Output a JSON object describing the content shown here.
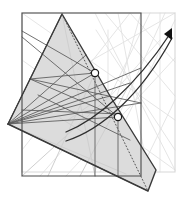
{
  "figure": {
    "canvas": {
      "width": 183,
      "height": 204,
      "background": "#ffffff"
    },
    "colors": {
      "stroke_dark": "#3a3a3a",
      "stroke_mid": "#5d5d5d",
      "stroke_light": "#cfcfcf",
      "stroke_faint": "#e2e2e2",
      "shape_fill": "#dcdcdc",
      "marker_fill": "#ffffff",
      "marker_stroke": "#1a1a1a",
      "arrow_fill": "#111111",
      "rect_outline_dark": "#4a4a4a",
      "rect_outline_light": "#d8d8d8"
    },
    "elements": {
      "outer_rect_dark": {
        "name": "bounding-rectangle-dark",
        "x": 22,
        "y": 13,
        "width": 119,
        "height": 163,
        "stroke": "#4a4a4a",
        "stroke_width": 1.1,
        "fill": "none"
      },
      "outer_rect_light": {
        "name": "bounding-rectangle-light",
        "x": 22,
        "y": 13,
        "width": 153,
        "height": 159,
        "stroke": "#d8d8d8",
        "stroke_width": 1.1,
        "fill": "none"
      },
      "shaded_polygon": {
        "name": "shaded-visibility-polygon",
        "points": "62,14 8,124 148,191 156,170 110,96",
        "fill": "#dcdcdc",
        "stroke": "#3a3a3a",
        "stroke_width": 1.4
      },
      "dotted_edge": {
        "name": "dotted-polygon-edge",
        "from": [
          62,
          14
        ],
        "to": [
          148,
          191
        ],
        "stroke": "#555555",
        "dash": "1.6 1.8",
        "stroke_width": 1.0
      },
      "markers": [
        {
          "name": "node-marker-upper",
          "cx": 95,
          "cy": 73,
          "r": 3.6
        },
        {
          "name": "node-marker-lower",
          "cx": 118,
          "cy": 117,
          "r": 3.6
        }
      ],
      "curves": [
        {
          "name": "trajectory-curve-upper",
          "path": "M 66,132 C 96,120 134,88 170,34",
          "stroke": "#2e2e2e",
          "stroke_width": 1.3
        },
        {
          "name": "trajectory-curve-lower",
          "path": "M 66,141 C 100,130 140,97 172,38",
          "stroke": "#2e2e2e",
          "stroke_width": 1.3
        }
      ],
      "arrowhead": {
        "name": "trajectory-arrowhead",
        "points": "172,28 172,40 164,34",
        "fill": "#111111"
      },
      "dark_chords": [
        {
          "name": "chord-dark-1",
          "x1": 8,
          "y1": 124,
          "x2": 62,
          "y2": 14
        },
        {
          "name": "chord-dark-2",
          "x1": 8,
          "y1": 124,
          "x2": 95,
          "y2": 73
        },
        {
          "name": "chord-dark-3",
          "x1": 8,
          "y1": 124,
          "x2": 118,
          "y2": 117
        },
        {
          "name": "chord-dark-4",
          "x1": 8,
          "y1": 124,
          "x2": 141,
          "y2": 103
        },
        {
          "name": "chord-dark-5",
          "x1": 8,
          "y1": 124,
          "x2": 130,
          "y2": 83
        },
        {
          "name": "chord-dark-6",
          "x1": 8,
          "y1": 124,
          "x2": 110,
          "y2": 96
        },
        {
          "name": "chord-dark-7",
          "x1": 8,
          "y1": 124,
          "x2": 86,
          "y2": 55
        },
        {
          "name": "chord-dark-8",
          "x1": 8,
          "y1": 124,
          "x2": 148,
          "y2": 191
        },
        {
          "name": "chord-dark-9",
          "x1": 22,
          "y1": 31,
          "x2": 95,
          "y2": 73
        },
        {
          "name": "chord-dark-10",
          "x1": 22,
          "y1": 37,
          "x2": 118,
          "y2": 117
        },
        {
          "name": "chord-dark-11",
          "x1": 30,
          "y1": 79,
          "x2": 118,
          "y2": 117
        },
        {
          "name": "chord-dark-12",
          "x1": 30,
          "y1": 79,
          "x2": 95,
          "y2": 73
        },
        {
          "name": "chord-dark-13",
          "x1": 30,
          "y1": 79,
          "x2": 141,
          "y2": 103
        },
        {
          "name": "chord-dark-14",
          "x1": 95,
          "y1": 73,
          "x2": 95,
          "y2": 176
        },
        {
          "name": "chord-dark-15",
          "x1": 118,
          "y1": 117,
          "x2": 118,
          "y2": 176
        },
        {
          "name": "chord-dark-16",
          "x1": 8,
          "y1": 124,
          "x2": 141,
          "y2": 68
        },
        {
          "name": "chord-dark-17",
          "x1": 38,
          "y1": 95,
          "x2": 130,
          "y2": 140
        },
        {
          "name": "chord-dark-18",
          "x1": 22,
          "y1": 110,
          "x2": 120,
          "y2": 114
        }
      ],
      "mid_chords": [
        {
          "name": "chord-mid-1",
          "x1": 62,
          "y1": 14,
          "x2": 8,
          "y2": 124
        },
        {
          "name": "chord-mid-2",
          "x1": 62,
          "y1": 14,
          "x2": 148,
          "y2": 191
        },
        {
          "name": "chord-mid-3",
          "x1": 22,
          "y1": 176,
          "x2": 110,
          "y2": 96
        },
        {
          "name": "chord-mid-4",
          "x1": 48,
          "y1": 176,
          "x2": 95,
          "y2": 73
        },
        {
          "name": "chord-mid-5",
          "x1": 80,
          "y1": 176,
          "x2": 130,
          "y2": 83
        },
        {
          "name": "chord-mid-6",
          "x1": 95,
          "y1": 176,
          "x2": 62,
          "y2": 14
        },
        {
          "name": "chord-mid-7",
          "x1": 8,
          "y1": 124,
          "x2": 126,
          "y2": 174
        },
        {
          "name": "chord-mid-8",
          "x1": 68,
          "y1": 120,
          "x2": 90,
          "y2": 105
        },
        {
          "name": "chord-mid-9",
          "x1": 60,
          "y1": 118,
          "x2": 86,
          "y2": 134
        }
      ],
      "light_chords": [
        {
          "name": "chord-light-1",
          "x1": 22,
          "y1": 13,
          "x2": 175,
          "y2": 120
        },
        {
          "name": "chord-light-2",
          "x1": 105,
          "y1": 13,
          "x2": 175,
          "y2": 96
        },
        {
          "name": "chord-light-3",
          "x1": 118,
          "y1": 13,
          "x2": 148,
          "y2": 172
        },
        {
          "name": "chord-light-4",
          "x1": 141,
          "y1": 13,
          "x2": 95,
          "y2": 172
        },
        {
          "name": "chord-light-5",
          "x1": 175,
          "y1": 20,
          "x2": 100,
          "y2": 172
        },
        {
          "name": "chord-light-6",
          "x1": 96,
          "y1": 30,
          "x2": 175,
          "y2": 150
        },
        {
          "name": "chord-light-7",
          "x1": 130,
          "y1": 13,
          "x2": 175,
          "y2": 62
        },
        {
          "name": "chord-light-8",
          "x1": 150,
          "y1": 13,
          "x2": 110,
          "y2": 96
        },
        {
          "name": "chord-light-9",
          "x1": 165,
          "y1": 13,
          "x2": 118,
          "y2": 117
        },
        {
          "name": "chord-light-10",
          "x1": 22,
          "y1": 150,
          "x2": 130,
          "y2": 13
        },
        {
          "name": "chord-light-11",
          "x1": 40,
          "y1": 176,
          "x2": 160,
          "y2": 40
        },
        {
          "name": "chord-light-12",
          "x1": 66,
          "y1": 176,
          "x2": 175,
          "y2": 58
        },
        {
          "name": "chord-light-13",
          "x1": 108,
          "y1": 30,
          "x2": 108,
          "y2": 172
        },
        {
          "name": "chord-light-14",
          "x1": 95,
          "y1": 13,
          "x2": 175,
          "y2": 170
        },
        {
          "name": "chord-light-15",
          "x1": 22,
          "y1": 100,
          "x2": 175,
          "y2": 13
        },
        {
          "name": "chord-light-16",
          "x1": 140,
          "y1": 172,
          "x2": 175,
          "y2": 100
        },
        {
          "name": "chord-light-17",
          "x1": 160,
          "y1": 13,
          "x2": 160,
          "y2": 172
        },
        {
          "name": "chord-light-18",
          "x1": 22,
          "y1": 60,
          "x2": 175,
          "y2": 170
        }
      ]
    }
  }
}
